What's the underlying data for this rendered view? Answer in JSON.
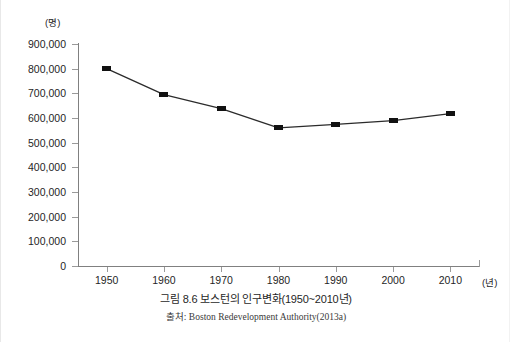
{
  "figure": {
    "caption": "그림 8.6 보스턴의 인구변화(1950~2010년)",
    "source": "출처: Boston Redevelopment Authority(2013a)",
    "y_unit": "(명)",
    "x_unit": "(년)"
  },
  "colors": {
    "line": "#2b2b2b",
    "marker": "#111111",
    "axis": "#808080",
    "background": "#ffffff",
    "text": "#1f1f1f"
  },
  "chart_data": {
    "type": "line",
    "title": "그림 8.6 보스턴의 인구변화(1950~2010년)",
    "xlabel": "(년)",
    "ylabel": "(명)",
    "categories": [
      "1950",
      "1960",
      "1970",
      "1980",
      "1990",
      "2000",
      "2010"
    ],
    "x": [
      1950,
      1960,
      1970,
      1980,
      1990,
      2000,
      2010
    ],
    "values": [
      800000,
      695000,
      638000,
      560000,
      574000,
      589000,
      618000
    ],
    "series": [
      {
        "name": "보스턴 인구",
        "values": [
          800000,
          695000,
          638000,
          560000,
          574000,
          589000,
          618000
        ]
      }
    ],
    "ylim": [
      0,
      900000
    ],
    "xlim": [
      1945,
      2015
    ],
    "ytick_labels": [
      "900,000",
      "800,000",
      "700,000",
      "600,000",
      "500,000",
      "400,000",
      "300,000",
      "200,000",
      "100,000",
      "0"
    ],
    "ytick_values": [
      900000,
      800000,
      700000,
      600000,
      500000,
      400000,
      300000,
      200000,
      100000,
      0
    ],
    "xtick_labels": [
      "1950",
      "1960",
      "1970",
      "1980",
      "1990",
      "2000",
      "2010"
    ],
    "grid": false,
    "legend": false,
    "markers": "square"
  }
}
